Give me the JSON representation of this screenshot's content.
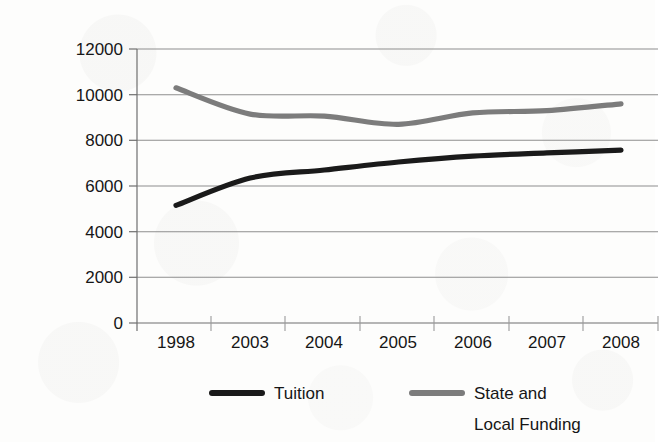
{
  "chart_data": {
    "type": "line",
    "title": "",
    "xlabel": "",
    "ylabel": "",
    "categories": [
      "1998",
      "2003",
      "2004",
      "2005",
      "2006",
      "2007",
      "2008"
    ],
    "x_tick_labels": [
      "1998",
      "2003",
      "2004",
      "2005",
      "2006",
      "2007",
      "2008"
    ],
    "y_tick_labels": [
      "0",
      "2000",
      "4000",
      "6000",
      "8000",
      "10000",
      "12000"
    ],
    "y_ticks": [
      0,
      2000,
      4000,
      6000,
      8000,
      10000,
      12000
    ],
    "ylim": [
      0,
      12000
    ],
    "grid": "horizontal",
    "legend_position": "bottom",
    "series": [
      {
        "name": "Tuition",
        "color": "#1a1a1a",
        "values": [
          5150,
          6350,
          6700,
          7050,
          7310,
          7450,
          7570
        ]
      },
      {
        "name": "State and Local Funding",
        "color": "#7c7c7c",
        "values": [
          10300,
          9150,
          9060,
          8700,
          9200,
          9300,
          9600
        ]
      }
    ]
  },
  "axis": {
    "y_labels": [
      "12000",
      "10000",
      "8000",
      "6000",
      "4000",
      "2000",
      "0"
    ],
    "x_labels": [
      "1998",
      "2003",
      "2004",
      "2005",
      "2006",
      "2007",
      "2008"
    ]
  },
  "legend": {
    "items": [
      {
        "label_line1": "Tuition",
        "label_line2": "",
        "color": "#1a1a1a"
      },
      {
        "label_line1": "State and",
        "label_line2": "Local Funding",
        "color": "#7c7c7c"
      }
    ]
  },
  "colors": {
    "tuition": "#1a1a1a",
    "state_local_funding": "#7c7c7c",
    "gridline": "#8e8e8e",
    "axis": "#6f6f6f",
    "text": "#161616",
    "background": "#fdfdfc"
  }
}
